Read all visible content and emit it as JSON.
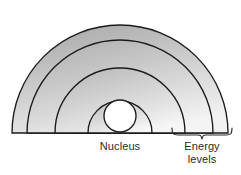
{
  "diagram": {
    "type": "atom-energy-level-diagram",
    "background_color": "#ffffff",
    "outline_color": "#1b1b1b",
    "fill_top_color": "#b4b4b4",
    "fill_bottom_color": "#efefef",
    "nucleus_fill_color": "#ffffff",
    "center": {
      "x": 120,
      "y": 133
    },
    "shells": [
      {
        "index": 1,
        "name": "outer-energy-level",
        "radius": 108
      },
      {
        "index": 2,
        "name": "third-energy-level",
        "radius": 93
      },
      {
        "index": 3,
        "name": "second-energy-level",
        "radius": 65
      },
      {
        "index": 4,
        "name": "first-energy-level",
        "radius": 32
      }
    ],
    "nucleus": {
      "name": "nucleus",
      "radius": 16,
      "cx": 120,
      "cy": 116
    },
    "labels": {
      "nucleus": "Nucleus",
      "energy_levels_line1": "Energy",
      "energy_levels_line2": "levels"
    },
    "brace": {
      "name": "energy-levels-brace",
      "x_start": 172,
      "x_end": 232,
      "y": 134,
      "tip_x": 202
    }
  }
}
